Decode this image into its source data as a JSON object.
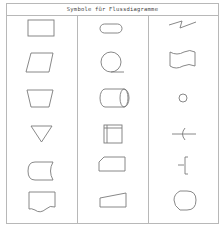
{
  "title": "Symbole für Flussdiagramme",
  "columns": [
    {
      "index": 0,
      "symbols": [
        "process-rectangle",
        "input-output-parallelogram",
        "manual-operation-trapezoid",
        "merge-triangle",
        "stored-data-shape",
        "document-shape"
      ]
    },
    {
      "index": 1,
      "symbols": [
        "terminator-rounded-rectangle",
        "sequential-access-storage-circle",
        "direct-access-storage-cylinder",
        "internal-storage-square",
        "card-shape",
        "manual-input-shape"
      ]
    },
    {
      "index": 2,
      "symbols": [
        "communication-link-zigzag",
        "punched-tape-wave",
        "connector-circle",
        "flow-arrow",
        "annotation-bracket",
        "display-shape"
      ]
    }
  ],
  "colors": {
    "border": "#b8b8b8",
    "stroke": "#7a7a7a",
    "text": "#444444"
  }
}
